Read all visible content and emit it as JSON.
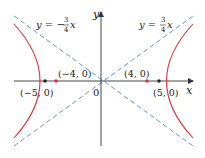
{
  "diagram": {
    "type": "hyperbola",
    "equation": "x^2/16 - y^2/9 = 1",
    "colors": {
      "hyperbola": "#d9363e",
      "asymptote": "#6f93c8",
      "axis": "#333333",
      "text": "#222222"
    },
    "axes": {
      "x_label": "x",
      "y_label": "y",
      "origin_label": "0"
    },
    "asymptotes": [
      {
        "lhs": "y = −",
        "num": "3",
        "den": "4",
        "var": "x",
        "slope": -0.75
      },
      {
        "lhs": "y = ",
        "num": "3",
        "den": "4",
        "var": "x",
        "slope": 0.75
      }
    ],
    "points": [
      {
        "label": "(−5, 0)",
        "x": -5,
        "y": 0,
        "kind": "focus"
      },
      {
        "label": "(−4, 0)",
        "x": -4,
        "y": 0,
        "kind": "vertex"
      },
      {
        "label": "(4, 0)",
        "x": 4,
        "y": 0,
        "kind": "vertex"
      },
      {
        "label": "(5, 0)",
        "x": 5,
        "y": 0,
        "kind": "focus"
      }
    ]
  }
}
